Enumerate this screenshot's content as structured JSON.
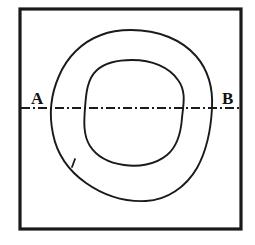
{
  "figure": {
    "background_color": "#ffffff",
    "line_color": "#1a1a1a",
    "frame": {
      "name": "outer-frame",
      "x": 20,
      "y": 9,
      "width": 221,
      "height": 220,
      "stroke_width": 3.2
    },
    "labels": {
      "left": "A",
      "right": "B",
      "left_x": 31,
      "left_y": 104,
      "right_x": 222,
      "right_y": 104
    },
    "section_line": {
      "name": "center-line-a-b",
      "y": 108,
      "x_start": 21,
      "x_end": 240,
      "pattern": "dash-dot",
      "dasharray": "9,3,2,3",
      "stroke_width": 1.8
    },
    "outer_contour": {
      "name": "outer-contour",
      "stroke_width": 1.9,
      "path": "M 131 30 C 159 30 182 40 196 56 C 209 71 213 90 212 108 C 211 128 207 150 197 168 C 186 187 167 200 146 201 C 124 202 103 195 86 183 C 69 171 57 154 53 134 C 49 115 51 94 59 76 C 67 57 82 42 101 35 C 111 31 121 30 131 30 Z"
    },
    "inner_contour": {
      "name": "inner-contour",
      "stroke_width": 1.9,
      "path": "M 132 60 C 152 60 169 67 178 80 C 187 92 183 106 182 118 C 181 132 178 146 167 155 C 155 165 138 167 124 165 C 110 163 97 157 90 146 C 83 135 84 121 85 108 C 86 94 87 79 97 70 C 106 62 119 60 132 60 Z"
    },
    "tick_mark": {
      "name": "contour-tick-mark",
      "x1": 72,
      "y1": 167,
      "x2": 75,
      "y2": 159,
      "stroke_width": 1.8
    }
  }
}
